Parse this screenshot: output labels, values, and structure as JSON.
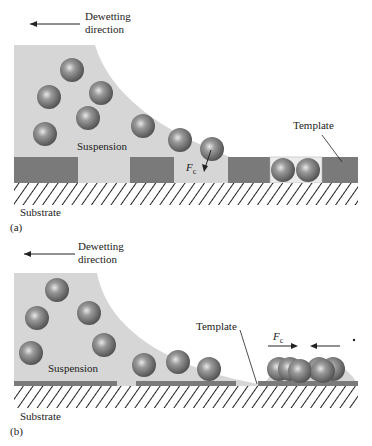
{
  "panel_a": {
    "dewetting_label_line1": "Dewetting",
    "dewetting_label_line2": "direction",
    "suspension_label": "Suspension",
    "template_label": "Template",
    "substrate_label": "Substrate",
    "force_label": "F",
    "force_subscript": "c",
    "panel_label": "(a)"
  },
  "panel_b": {
    "dewetting_label_line1": "Dewetting",
    "dewetting_label_line2": "direction",
    "suspension_label": "Suspension",
    "template_label": "Template",
    "substrate_label": "Substrate",
    "force_label": "F",
    "force_subscript": "c",
    "panel_label": "(b)"
  },
  "colors": {
    "suspension": "#d6d6d6",
    "template": "#7a7a7a",
    "sphere": "#6e6e6e",
    "hatch": "#222222"
  }
}
